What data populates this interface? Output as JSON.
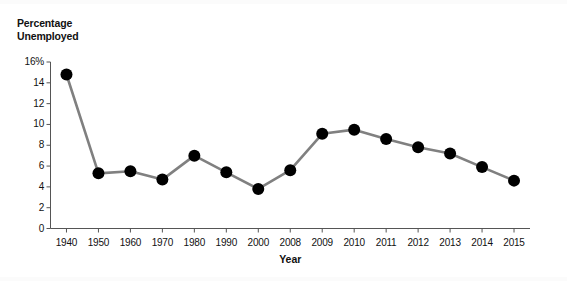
{
  "chart_data": {
    "type": "line",
    "title": "",
    "ylabel": "Percentage Unemployed",
    "ylabel_line1": "Percentage",
    "ylabel_line2": "Unemployed",
    "xlabel": "Year",
    "categories": [
      "1940",
      "1950",
      "1960",
      "1970",
      "1980",
      "1990",
      "2000",
      "2008",
      "2009",
      "2010",
      "2011",
      "2012",
      "2013",
      "2014",
      "2015"
    ],
    "values": [
      14.8,
      5.3,
      5.5,
      4.7,
      7.0,
      5.4,
      3.8,
      5.6,
      9.1,
      9.5,
      8.6,
      7.8,
      7.2,
      5.9,
      4.6
    ],
    "series": [
      {
        "name": "Percentage Unemployed",
        "values": [
          14.8,
          5.3,
          5.5,
          4.7,
          7.0,
          5.4,
          3.8,
          5.6,
          9.1,
          9.5,
          8.6,
          7.8,
          7.2,
          5.9,
          4.6
        ]
      }
    ],
    "ylim": [
      0,
      16
    ],
    "ytick_labels": [
      "16%",
      "14",
      "12",
      "10",
      "8",
      "6",
      "4",
      "2",
      "0"
    ],
    "ytick_values": [
      16,
      14,
      12,
      10,
      8,
      6,
      4,
      2,
      0
    ],
    "xtick_labels": [
      "1940",
      "1950",
      "1960",
      "1970",
      "1980",
      "1990",
      "2000",
      "2008",
      "2009",
      "2010",
      "2011",
      "2012",
      "2013",
      "2014",
      "2015"
    ],
    "grid": false,
    "legend": "none",
    "line_color": "#808080",
    "marker_color": "#000000",
    "axis_color": "#555555",
    "marker_shape": "circle",
    "marker_size": 6
  }
}
